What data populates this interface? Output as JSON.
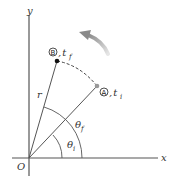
{
  "diagram": {
    "type": "circular-motion-angular-position",
    "axes": {
      "x_label": "x",
      "y_label": "y",
      "origin_label": "O"
    },
    "points": [
      {
        "id": "A",
        "circle_label": "A",
        "time_label": "t",
        "time_sub": "i",
        "color": "#888888"
      },
      {
        "id": "B",
        "circle_label": "B",
        "time_label": "t",
        "time_sub": "f",
        "color": "#111111"
      }
    ],
    "radius_label": "r",
    "angles": [
      {
        "id": "theta_i",
        "symbol": "θ",
        "sub": "i"
      },
      {
        "id": "theta_f",
        "symbol": "θ",
        "sub": "f"
      }
    ],
    "motion_arrow": {
      "direction": "counterclockwise",
      "color": "#9a9a9a"
    },
    "path_style": "dashed"
  }
}
